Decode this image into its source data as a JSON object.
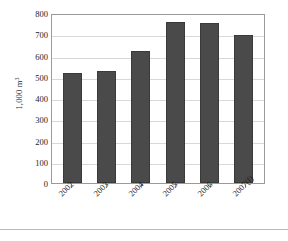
{
  "chart_data": {
    "type": "bar",
    "title": "",
    "subtitle": "",
    "xlabel": "",
    "ylabel": "1,000 m3",
    "ylabel_prefix": "1,000 m",
    "ylabel_superscript": "3",
    "categories": [
      "2002",
      "2003",
      "2004",
      "2005",
      "2006",
      "2007(f)"
    ],
    "values": [
      520,
      527,
      619,
      756,
      753,
      698
    ],
    "series": [
      {
        "name": "Volume",
        "values": [
          520,
          527,
          619,
          756,
          753,
          698
        ]
      }
    ],
    "ylim": [
      0,
      800
    ],
    "ytick_values": [
      0,
      100,
      200,
      300,
      400,
      500,
      600,
      700,
      800
    ],
    "ytick_labels": [
      "0",
      "100",
      "200",
      "300",
      "400",
      "500",
      "600",
      "700",
      "800"
    ],
    "grid": true,
    "grid_axis": "y",
    "legend": false,
    "legend_position": "none",
    "bar_color": "#4a4a4a",
    "bar_edge_color": "#3a3a3a",
    "gridline_color": "#d8d8d8",
    "frame_color": "#9a9a9a",
    "text_color": "#1d1d1d",
    "background_color": "#ffffff",
    "xtick_label_rotation": -45
  }
}
